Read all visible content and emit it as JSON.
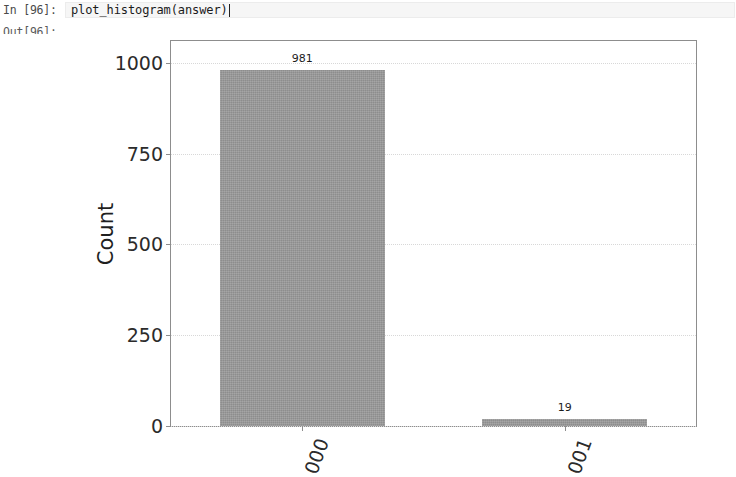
{
  "notebook": {
    "input_prompt": "In [96]:",
    "output_prompt": "Out[96]:",
    "code": "plot_histogram(answer)"
  },
  "chart_data": {
    "type": "bar",
    "title": "",
    "xlabel": "",
    "ylabel": "Count",
    "categories": [
      "000",
      "001"
    ],
    "values": [
      981,
      19
    ],
    "value_labels": [
      "981",
      "19"
    ],
    "ylim": [
      0,
      1060
    ],
    "yticks": [
      0,
      250,
      500,
      750,
      1000
    ],
    "ytick_labels": [
      "0",
      "250",
      "500",
      "750",
      "1000"
    ],
    "grid": true,
    "legend": null,
    "bar_color": "#9b9b9b",
    "axes_color": "#8d8d8d",
    "xtick_rotation": -70
  }
}
